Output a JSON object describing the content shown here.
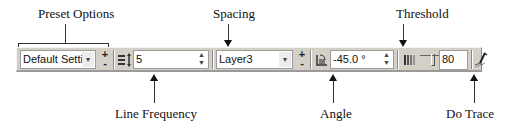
{
  "callouts": {
    "preset_options": "Preset Options",
    "spacing": "Spacing",
    "threshold": "Threshold",
    "line_frequency": "Line Frequency",
    "angle": "Angle",
    "do_trace": "Do Trace"
  },
  "toolbar": {
    "preset": {
      "value": "Default Settin",
      "dropdown_icon": "chevron-down-icon"
    },
    "preset_add": "+",
    "preset_remove": "-",
    "line_frequency": {
      "icon": "line-frequency-icon",
      "value": "5"
    },
    "layer": {
      "value": "Layer3",
      "dropdown_icon": "chevron-down-icon"
    },
    "layer_add": "+",
    "layer_remove": "-",
    "angle": {
      "icon": "angle-icon",
      "value": "-45.0 °"
    },
    "threshold": {
      "icon": "threshold-icon",
      "value": "80"
    },
    "do_trace": {
      "icon": "trace-pen-icon"
    }
  },
  "colors": {
    "toolbar_bg": "#d4d0c8",
    "field_bg": "#ffffff"
  }
}
